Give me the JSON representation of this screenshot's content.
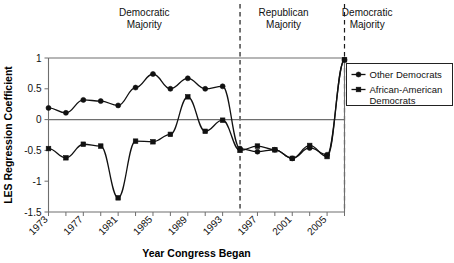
{
  "chart_data": {
    "type": "line",
    "title": "",
    "xlabel": "Year Congress Began",
    "ylabel": "LES Regression Coefficient",
    "xlim": [
      1973,
      2007
    ],
    "ylim": [
      -1.5,
      1
    ],
    "grid": false,
    "legend_position": "right",
    "y_ticks": [
      "1",
      "0.5",
      "0",
      "-0.5",
      "-1",
      "-1.5"
    ],
    "y_tick_values": [
      1,
      0.5,
      0,
      -0.5,
      -1,
      -1.5
    ],
    "x_tick_labels": [
      "1973",
      "1977",
      "1981",
      "1985",
      "1989",
      "1993",
      "1997",
      "2001",
      "2005"
    ],
    "x_tick_label_values": [
      1973,
      1977,
      1981,
      1985,
      1989,
      1993,
      1997,
      2001,
      2005
    ],
    "x_minor_ticks": [
      1973,
      1975,
      1977,
      1979,
      1981,
      1983,
      1985,
      1987,
      1989,
      1991,
      1993,
      1995,
      1997,
      1999,
      2001,
      2003,
      2005,
      2007
    ],
    "x": [
      1973,
      1975,
      1977,
      1979,
      1981,
      1983,
      1985,
      1987,
      1989,
      1991,
      1993,
      1995,
      1997,
      1999,
      2001,
      2003,
      2005,
      2007
    ],
    "series": [
      {
        "name": "Other Democrats",
        "marker": "circle",
        "values": [
          0.19,
          0.11,
          0.32,
          0.3,
          0.23,
          0.52,
          0.74,
          0.5,
          0.67,
          0.5,
          0.54,
          -0.47,
          -0.52,
          -0.49,
          -0.63,
          -0.46,
          -0.57,
          0.97
        ]
      },
      {
        "name": "African-American Democrats",
        "marker": "square",
        "values": [
          -0.47,
          -0.62,
          -0.4,
          -0.43,
          -1.27,
          -0.35,
          -0.36,
          -0.24,
          0.37,
          -0.19,
          -0.01,
          -0.5,
          -0.43,
          -0.49,
          -0.63,
          -0.42,
          -0.6,
          0.97
        ]
      }
    ],
    "annotations": [
      {
        "text_line1": "Democratic",
        "text_line2": "Majority",
        "center_year": 1984
      },
      {
        "text_line1": "Republican",
        "text_line2": "Majority",
        "center_year": 2000
      },
      {
        "text_line1": "Democratic",
        "text_line2": "Majority",
        "center_year": 2009.6
      }
    ],
    "dividers": [
      1995,
      2007
    ],
    "colors": {
      "line": "#111111",
      "axis": "#6e6e6e",
      "text": "#111111"
    }
  }
}
